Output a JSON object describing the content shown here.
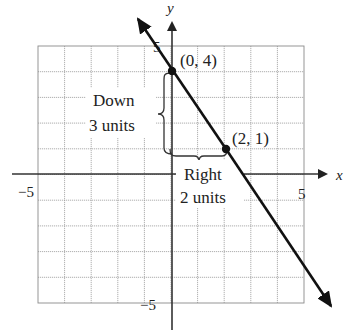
{
  "chart_data": {
    "type": "line",
    "title": "",
    "xlabel": "x",
    "ylabel": "y",
    "xlim": [
      -5,
      5
    ],
    "ylim": [
      -5,
      5
    ],
    "grid": true,
    "x_tick_labels": [
      "-5",
      "5"
    ],
    "y_tick_labels": [
      "5",
      "-5"
    ],
    "line": {
      "slope": -1.5,
      "intercept": 4,
      "equation": "y = -3/2 x + 4",
      "x_start": -1.3,
      "x_end": 5.9
    },
    "points": [
      {
        "x": 0,
        "y": 4,
        "label": "(0, 4)"
      },
      {
        "x": 2,
        "y": 1,
        "label": "(2, 1)"
      }
    ],
    "annotations": [
      {
        "text_line1": "Down",
        "text_line2": "3 units",
        "type": "vertical-brace",
        "from": [
          0,
          4
        ],
        "to": [
          0,
          1
        ]
      },
      {
        "text_line1": "Right",
        "text_line2": "2 units",
        "type": "horizontal-brace",
        "from": [
          0,
          1
        ],
        "to": [
          2,
          1
        ]
      }
    ]
  },
  "labels": {
    "x_axis": "x",
    "y_axis": "y",
    "x_min": "−5",
    "x_max": "5",
    "y_max": "5",
    "y_min": "−5",
    "point_a": "(0, 4)",
    "point_b": "(2, 1)",
    "down_1": "Down",
    "down_2": "3 units",
    "right_1": "Right",
    "right_2": "2 units"
  }
}
